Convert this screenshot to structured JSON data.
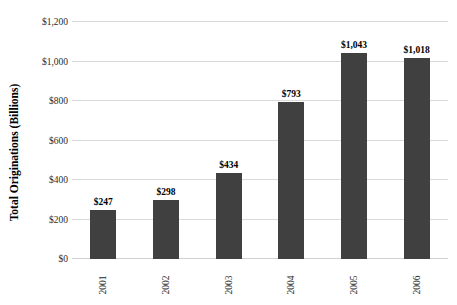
{
  "chart_data": {
    "type": "bar",
    "title": "",
    "xlabel": "",
    "ylabel": "Total Originations (Billions)",
    "categories": [
      "2001",
      "2002",
      "2003",
      "2004",
      "2005",
      "2006"
    ],
    "values": [
      247,
      298,
      434,
      793,
      1043,
      1018
    ],
    "value_labels": [
      "$247",
      "$298",
      "$434",
      "$793",
      "$1,043",
      "$1,018"
    ],
    "ylim": [
      0,
      1200
    ],
    "ytick_values": [
      0,
      200,
      400,
      600,
      800,
      1000,
      1200
    ],
    "ytick_labels": [
      "$0",
      "$200",
      "$400",
      "$600",
      "$800",
      "$1,000",
      "$1,200"
    ],
    "grid": true,
    "legend": false,
    "series": [
      {
        "name": "Total Originations",
        "values": [
          247,
          298,
          434,
          793,
          1043,
          1018
        ],
        "color": "#404040"
      }
    ],
    "colors": {
      "bar": "#404040",
      "gridline": "#d9d9d9",
      "background": "#ffffff",
      "text": "#000000"
    }
  }
}
